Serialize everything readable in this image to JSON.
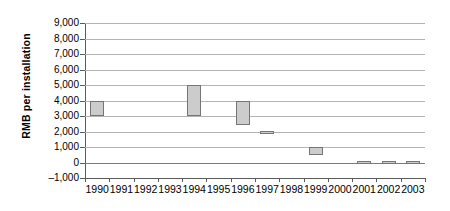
{
  "chart_data": {
    "type": "bar",
    "subtype": "floating-range-bar",
    "title": "",
    "xlabel": "",
    "ylabel": "RMB per installation",
    "ylim": [
      -1000,
      9000
    ],
    "ytick_step": 1000,
    "ytick_labels": [
      "9,000",
      "8,000",
      "7,000",
      "6,000",
      "5,000",
      "4,000",
      "3,000",
      "2,000",
      "1,000",
      "0",
      "–1,000"
    ],
    "ytick_values": [
      9000,
      8000,
      7000,
      6000,
      5000,
      4000,
      3000,
      2000,
      1000,
      0,
      -1000
    ],
    "grid": true,
    "legend": false,
    "legend_position": "none",
    "bar_fill_color": "#cccccc",
    "bar_border_color": "#757575",
    "gridline_color": "#b4b4b4",
    "axis_color": "#5a5a5a",
    "categories": [
      "1990",
      "1991",
      "1992",
      "1993",
      "1994",
      "1995",
      "1996",
      "1997",
      "1998",
      "1999",
      "2000",
      "2001",
      "2002",
      "2003"
    ],
    "series": [
      {
        "name": "RMB per installation range",
        "low": [
          3000,
          null,
          null,
          null,
          3000,
          null,
          2400,
          1900,
          null,
          500,
          null,
          0,
          0,
          0
        ],
        "high": [
          4000,
          null,
          null,
          null,
          5000,
          null,
          4000,
          2050,
          null,
          1000,
          null,
          100,
          100,
          100
        ]
      }
    ],
    "bars": [
      {
        "category": "1990",
        "low": 3000,
        "high": 4000
      },
      {
        "category": "1994",
        "low": 3000,
        "high": 5000
      },
      {
        "category": "1996",
        "low": 2400,
        "high": 4000
      },
      {
        "category": "1997",
        "low": 1900,
        "high": 2050
      },
      {
        "category": "1999",
        "low": 500,
        "high": 1000
      },
      {
        "category": "2001",
        "low": 0,
        "high": 100
      },
      {
        "category": "2002",
        "low": 0,
        "high": 100
      },
      {
        "category": "2003",
        "low": 0,
        "high": 100
      }
    ]
  }
}
